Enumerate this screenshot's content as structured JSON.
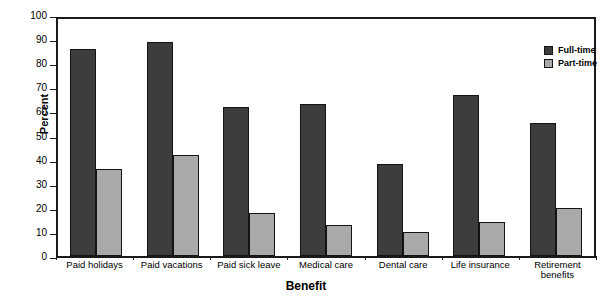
{
  "chart_data": {
    "type": "bar",
    "title": "",
    "xlabel": "Benefit",
    "ylabel": "Percent",
    "ylim": [
      0,
      100
    ],
    "ytick_step": 10,
    "yticks": [
      100,
      90,
      80,
      70,
      60,
      50,
      40,
      30,
      20,
      10,
      0
    ],
    "grid": false,
    "legend_position": "top-right",
    "categories": [
      "Paid holidays",
      "Paid vacations",
      "Paid sick leave",
      "Medical care",
      "Dental care",
      "Life insurance",
      "Retirement\nbenefits"
    ],
    "series": [
      {
        "name": "Full-time",
        "color": "#3d3d3d",
        "values": [
          86,
          89,
          62,
          63,
          38,
          67,
          55
        ]
      },
      {
        "name": "Part-time",
        "color": "#a9a9a9",
        "values": [
          36,
          42,
          18,
          13,
          10,
          14,
          20
        ]
      }
    ]
  },
  "axes": {
    "y_title": "Percent",
    "x_title": "Benefit"
  },
  "legend": {
    "items": [
      {
        "label": "Full-time"
      },
      {
        "label": "Part-time"
      }
    ]
  },
  "colors": {
    "full_time": "#3d3d3d",
    "part_time": "#a9a9a9",
    "frame": "#1a1a1a",
    "background": "#ffffff"
  }
}
